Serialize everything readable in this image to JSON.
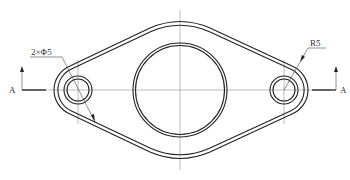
{
  "drawing": {
    "title": "Flange plate (diamond-shaped, two bolt holes)",
    "annotations": {
      "hole_callout": "2×Φ5",
      "radius_callout": "R5",
      "section_left": "A",
      "section_right": "A"
    },
    "colors": {
      "line": "#222222",
      "centerline": "#777777",
      "text": "#333333",
      "background": "#ffffff"
    }
  }
}
